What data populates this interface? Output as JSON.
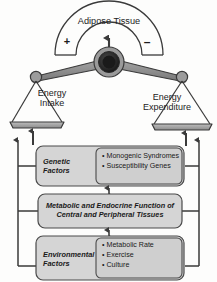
{
  "figure": {
    "colors": {
      "stroke": "#3a3a3a",
      "beam_fill": "#8f8f8f",
      "hub_dark": "#2b2b2b",
      "hub_mid": "#6e6e6e",
      "box_fill": "#d5d5d5",
      "box_list_fill": "#cfcfcf",
      "background": "#fdfdfc"
    }
  },
  "gauge": {
    "label": "Adipose Tissue",
    "positive_sign": "+",
    "negative_sign": "–",
    "needle_icon": "up-arrow-icon"
  },
  "balance": {
    "left_pan": {
      "label": "Energy\nIntake",
      "input_arrow_icon": "up-arrow-icon"
    },
    "right_pan": {
      "label": "Energy\nExpenditure",
      "input_arrow_icon": "up-arrow-icon"
    }
  },
  "factors": [
    {
      "id": "genetic",
      "title": "Genetic Factors",
      "items": [
        "Monogenic Syndromes",
        "Susceptibility Genes"
      ]
    },
    {
      "id": "metabolic",
      "title": "Metabolic and Endocrine Function of\nCentral and Peripheral Tissues",
      "items": []
    },
    {
      "id": "environmental",
      "title": "Environmental\nFactors",
      "items": [
        "Metabolic Rate",
        "Exercise",
        "Culture"
      ]
    }
  ],
  "connectors": {
    "between_genetic_and_metabolic": "double-headed-vertical-arrow-icon",
    "between_metabolic_and_environmental": "double-headed-vertical-arrow-icon",
    "left_bracket": "up-arrow-bracket-icon",
    "right_bracket": "up-arrow-bracket-icon"
  }
}
